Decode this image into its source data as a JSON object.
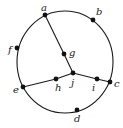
{
  "diagram": {
    "type": "graph",
    "outer_cycle": {
      "cx": 65,
      "cy": 62,
      "rx": 48,
      "ry": 51,
      "vertices_on_cycle": [
        "a",
        "b",
        "c",
        "d",
        "e",
        "f"
      ]
    },
    "vertices": [
      {
        "id": "a",
        "label": "a",
        "x": 45,
        "y": 15,
        "lx": 41,
        "ly": 11
      },
      {
        "id": "b",
        "label": "b",
        "x": 93,
        "y": 20,
        "lx": 96,
        "ly": 15
      },
      {
        "id": "c",
        "label": "c",
        "x": 110,
        "y": 82,
        "lx": 114,
        "ly": 87
      },
      {
        "id": "d",
        "label": "d",
        "x": 77,
        "y": 110,
        "lx": 74,
        "ly": 122
      },
      {
        "id": "e",
        "label": "e",
        "x": 23,
        "y": 87,
        "lx": 13,
        "ly": 93
      },
      {
        "id": "f",
        "label": "f",
        "x": 17,
        "y": 48,
        "lx": 8,
        "ly": 53
      },
      {
        "id": "g",
        "label": "g",
        "x": 64,
        "y": 54,
        "lx": 69,
        "ly": 56
      },
      {
        "id": "h",
        "label": "h",
        "x": 56,
        "y": 79,
        "lx": 55,
        "ly": 91
      },
      {
        "id": "i",
        "label": "i",
        "x": 97,
        "y": 79,
        "lx": 92,
        "ly": 91
      },
      {
        "id": "j",
        "label": "j",
        "x": 73,
        "y": 73,
        "lx": 71,
        "ly": 86
      }
    ],
    "edges": [
      [
        "a",
        "g"
      ],
      [
        "g",
        "j"
      ],
      [
        "e",
        "h"
      ],
      [
        "h",
        "j"
      ],
      [
        "j",
        "i"
      ],
      [
        "i",
        "c"
      ]
    ],
    "colors": {
      "stroke": "#1a1a1a",
      "vertex": "#111111",
      "label": "#222222",
      "background": "#ffffff"
    }
  }
}
